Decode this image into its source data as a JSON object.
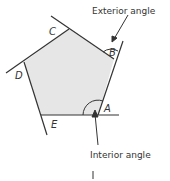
{
  "diagram": {
    "vertices": [
      {
        "id": "A",
        "label": "A"
      },
      {
        "id": "B",
        "label": "B"
      },
      {
        "id": "C",
        "label": "C"
      },
      {
        "id": "D",
        "label": "D"
      },
      {
        "id": "E",
        "label": "E"
      }
    ],
    "annotations": {
      "exterior": "Exterior angle",
      "interior": "Interior angle"
    },
    "colors": {
      "fill": "#e6e6e6",
      "stroke": "#333333",
      "background": "#ffffff"
    }
  }
}
